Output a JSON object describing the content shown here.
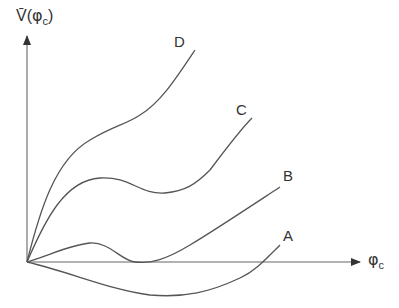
{
  "axes": {
    "y_label_main": "V̄(",
    "y_label_phi": "φ",
    "y_label_sub": "c",
    "y_label_close": ")",
    "x_label_phi": "φ",
    "x_label_sub": "c"
  },
  "curves": [
    {
      "label": "A",
      "description": "dips below zero to a minimum then rises crossing the axis"
    },
    {
      "label": "B",
      "description": "small local max, returns to zero minimum, then rises"
    },
    {
      "label": "C",
      "description": "rises to local max, shallow local min, then rises"
    },
    {
      "label": "D",
      "description": "rises steeply with inflection shoulder, then rises further"
    }
  ],
  "colors": {
    "line": "#555555",
    "text": "#333333",
    "background": "#ffffff"
  }
}
